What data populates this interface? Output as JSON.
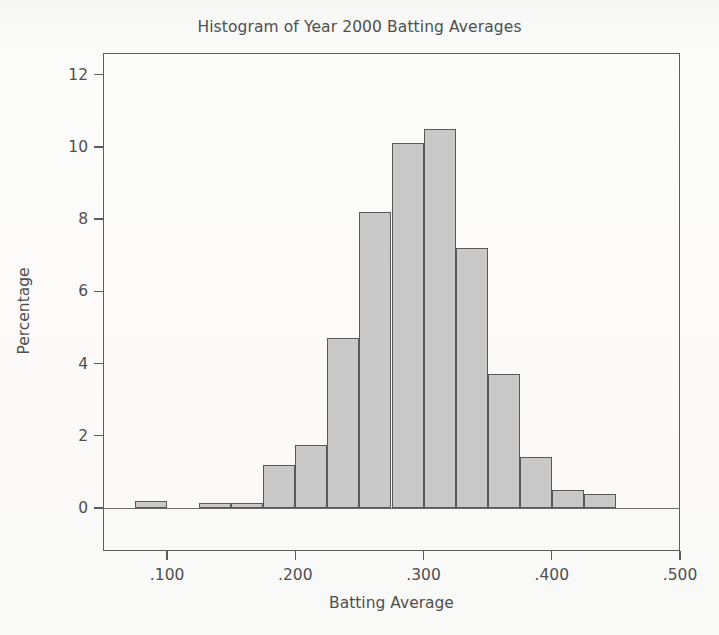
{
  "figure": {
    "title": "Histogram of Year 2000 Batting Averages",
    "xlabel": "Batting Average",
    "ylabel": "Percentage"
  },
  "style": {
    "bar_fill": "#c9c9c9",
    "bar_edge": "#595959",
    "axis_color": "#5c5c5c",
    "text_color": "#4f4f4f",
    "background": "#fbfbfa"
  },
  "ghost_text": "a\nthe\nthe\n",
  "chart_data": {
    "type": "bar",
    "subtype": "histogram",
    "title": "Histogram of Year 2000 Batting Averages",
    "xlabel": "Batting Average",
    "ylabel": "Percentage",
    "xlim": [
      0.05,
      0.5
    ],
    "ylim": [
      0,
      12.6
    ],
    "grid": false,
    "legend": null,
    "bin_width": 0.025,
    "xticks": [
      0.1,
      0.2,
      0.3,
      0.4,
      0.5
    ],
    "xtick_labels": [
      ".100",
      ".200",
      ".300",
      ".400",
      ".500"
    ],
    "yticks": [
      0,
      2,
      4,
      6,
      8,
      10,
      12
    ],
    "ytick_labels": [
      "0",
      "2",
      "4",
      "6",
      "8",
      "10",
      "12"
    ],
    "bins": [
      {
        "x0": 0.075,
        "x1": 0.1,
        "value": 0.2
      },
      {
        "x0": 0.1,
        "x1": 0.125,
        "value": 0.0
      },
      {
        "x0": 0.125,
        "x1": 0.15,
        "value": 0.15
      },
      {
        "x0": 0.15,
        "x1": 0.175,
        "value": 0.15
      },
      {
        "x0": 0.175,
        "x1": 0.2,
        "value": 1.2
      },
      {
        "x0": 0.2,
        "x1": 0.225,
        "value": 1.75
      },
      {
        "x0": 0.225,
        "x1": 0.25,
        "value": 4.7
      },
      {
        "x0": 0.25,
        "x1": 0.275,
        "value": 8.2
      },
      {
        "x0": 0.275,
        "x1": 0.3,
        "value": 10.1
      },
      {
        "x0": 0.3,
        "x1": 0.325,
        "value": 10.5
      },
      {
        "x0": 0.325,
        "x1": 0.35,
        "value": 7.2
      },
      {
        "x0": 0.35,
        "x1": 0.375,
        "value": 3.7
      },
      {
        "x0": 0.375,
        "x1": 0.4,
        "value": 1.4
      },
      {
        "x0": 0.4,
        "x1": 0.425,
        "value": 0.5
      },
      {
        "x0": 0.425,
        "x1": 0.45,
        "value": 0.4
      }
    ],
    "categories": [
      "0.075-0.100",
      "0.100-0.125",
      "0.125-0.150",
      "0.150-0.175",
      "0.175-0.200",
      "0.200-0.225",
      "0.225-0.250",
      "0.250-0.275",
      "0.275-0.300",
      "0.300-0.325",
      "0.325-0.350",
      "0.350-0.375",
      "0.375-0.400",
      "0.400-0.425",
      "0.425-0.450"
    ],
    "values": [
      0.2,
      0.0,
      0.15,
      0.15,
      1.2,
      1.75,
      4.7,
      8.2,
      10.1,
      10.5,
      7.2,
      3.7,
      1.4,
      0.5,
      0.4
    ]
  }
}
